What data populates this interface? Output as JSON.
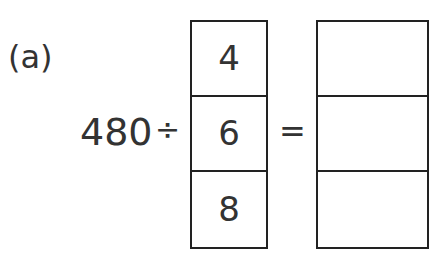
{
  "problem": {
    "label": "(a)",
    "dividend": "480",
    "operator": "÷",
    "equals": "=",
    "divisor_options": [
      "4",
      "6",
      "8"
    ],
    "answer_boxes": [
      "",
      "",
      ""
    ]
  }
}
